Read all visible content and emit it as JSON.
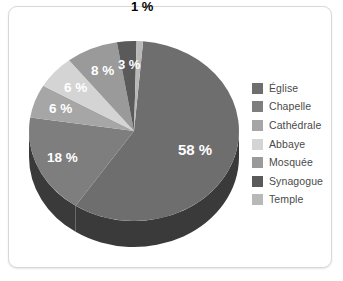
{
  "card": {
    "border_color": "#d8d8d8",
    "background": "#ffffff"
  },
  "chart_data": {
    "type": "pie",
    "title": "",
    "subtitle": "",
    "xlabel": "",
    "ylabel": "",
    "unit": "%",
    "legend_position": "right",
    "grid": false,
    "three_d": true,
    "categories": [
      "Église",
      "Chapelle",
      "Cathédrale",
      "Abbaye",
      "Mosquée",
      "Synagogue",
      "Temple"
    ],
    "values": [
      58,
      18,
      6,
      6,
      8,
      3,
      1
    ],
    "labels": [
      "58 %",
      "18 %",
      "6 %",
      "6 %",
      "8 %",
      "3 %",
      "1 %"
    ],
    "colors": [
      "#6e6e6e",
      "#7e7e7e",
      "#a6a6a6",
      "#d4d4d4",
      "#9a9a9a",
      "#5a5a5a",
      "#b8b8b8"
    ],
    "side_color": "#3a3a3a",
    "label_colors": [
      "#ffffff",
      "#ffffff",
      "#ffffff",
      "#ffffff",
      "#ffffff",
      "#ffffff",
      "#000000"
    ],
    "slices": [
      {
        "name": "Église",
        "value": 58,
        "label": "58 %",
        "color": "#6e6e6e",
        "label_color": "#ffffff"
      },
      {
        "name": "Chapelle",
        "value": 18,
        "label": "18 %",
        "color": "#7e7e7e",
        "label_color": "#ffffff"
      },
      {
        "name": "Cathédrale",
        "value": 6,
        "label": "6 %",
        "color": "#a6a6a6",
        "label_color": "#ffffff"
      },
      {
        "name": "Abbaye",
        "value": 6,
        "label": "6 %",
        "color": "#d4d4d4",
        "label_color": "#ffffff"
      },
      {
        "name": "Mosquée",
        "value": 8,
        "label": "8 %",
        "color": "#9a9a9a",
        "label_color": "#ffffff"
      },
      {
        "name": "Synagogue",
        "value": 3,
        "label": "3 %",
        "color": "#5a5a5a",
        "label_color": "#ffffff"
      },
      {
        "name": "Temple",
        "value": 1,
        "label": "1 %",
        "color": "#b8b8b8",
        "label_color": "#000000"
      }
    ]
  },
  "legend": {
    "items": [
      {
        "label": "Église",
        "color": "#6e6e6e"
      },
      {
        "label": "Chapelle",
        "color": "#7e7e7e"
      },
      {
        "label": "Cathédrale",
        "color": "#a6a6a6"
      },
      {
        "label": "Abbaye",
        "color": "#d4d4d4"
      },
      {
        "label": "Mosquée",
        "color": "#9a9a9a"
      },
      {
        "label": "Synagogue",
        "color": "#5a5a5a"
      },
      {
        "label": "Temple",
        "color": "#b8b8b8"
      }
    ]
  }
}
